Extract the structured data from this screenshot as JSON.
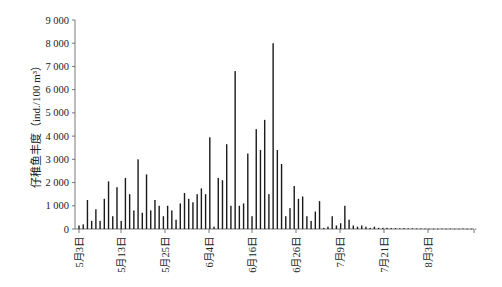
{
  "chart_data": {
    "type": "bar",
    "title": "",
    "xlabel": "",
    "ylabel": "仔稚鱼丰度（ind./100 m³）",
    "ylim": [
      0,
      9000
    ],
    "yticks": [
      0,
      1000,
      2000,
      3000,
      4000,
      5000,
      6000,
      7000,
      8000,
      9000
    ],
    "ytick_labels": [
      "0",
      "1 000",
      "2 000",
      "3 000",
      "4 000",
      "5 000",
      "6 000",
      "7 000",
      "8 000",
      "9 000"
    ],
    "xtick_labels": [
      "5月3日",
      "5月13日",
      "5月25日",
      "6月4日",
      "6月16日",
      "6月26日",
      "7月9日",
      "7月21日",
      "8月3日"
    ],
    "grid": false,
    "legend": null,
    "series": [
      {
        "name": "仔稚鱼丰度",
        "values": [
          150,
          200,
          1250,
          350,
          850,
          350,
          1300,
          2050,
          550,
          1800,
          350,
          2200,
          1500,
          800,
          3000,
          700,
          2350,
          800,
          1250,
          1000,
          550,
          1000,
          800,
          400,
          1100,
          1550,
          1300,
          1150,
          1500,
          1750,
          1500,
          3950,
          100,
          2200,
          2100,
          3650,
          1000,
          6800,
          1000,
          1100,
          3250,
          550,
          4300,
          3400,
          4700,
          1500,
          8000,
          3400,
          2800,
          550,
          900,
          1850,
          1300,
          1400,
          550,
          350,
          750,
          1200,
          50,
          100,
          550,
          150,
          250,
          1000,
          400,
          150,
          100,
          150,
          100,
          50,
          100,
          50,
          50,
          50,
          40,
          40,
          30,
          40,
          30,
          30,
          20,
          20,
          20,
          10,
          10,
          10,
          20,
          10,
          20,
          10,
          10,
          20,
          10,
          10,
          10
        ]
      }
    ]
  },
  "colors": {
    "bar": "#1a1a1a",
    "axis": "#555555",
    "text": "#222222"
  }
}
